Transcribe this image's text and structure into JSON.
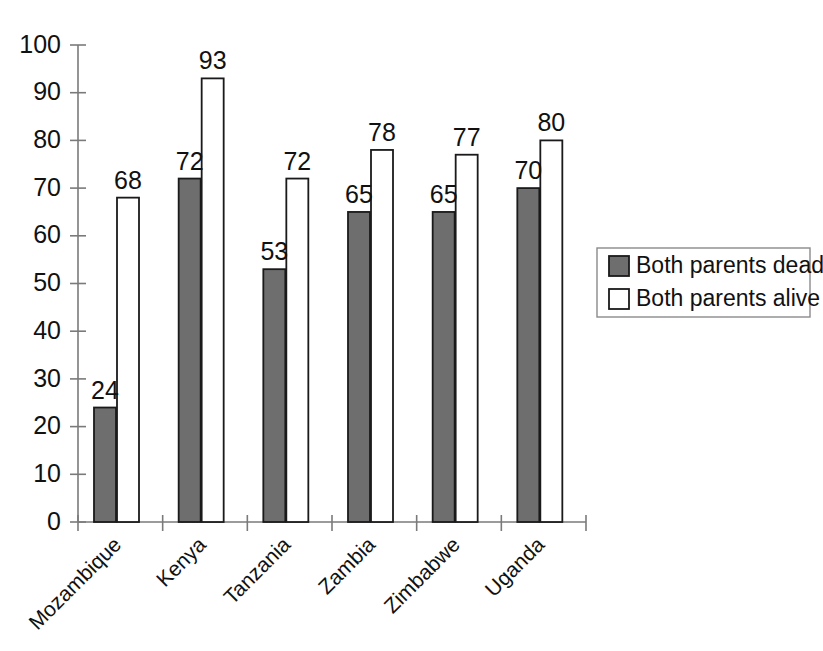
{
  "chart_data": {
    "type": "bar",
    "title": "",
    "subtitle": "",
    "xlabel": "",
    "ylabel": "",
    "ylim": [
      0,
      100
    ],
    "yticks": [
      0,
      10,
      20,
      30,
      40,
      50,
      60,
      70,
      80,
      90,
      100
    ],
    "ytick_labels": [
      "0",
      "10",
      "20",
      "30",
      "40",
      "50",
      "60",
      "70",
      "80",
      "90",
      "100"
    ],
    "grid": false,
    "legend_position": "right",
    "categories": [
      "Mozambique",
      "Kenya",
      "Tanzania",
      "Zambia",
      "Zimbabwe",
      "Uganda"
    ],
    "series": [
      {
        "name": "Both parents dead",
        "color": "#6e6e6e",
        "values": [
          24,
          72,
          53,
          65,
          65,
          70
        ],
        "value_labels": [
          "24",
          "72",
          "53",
          "65",
          "65",
          "70"
        ]
      },
      {
        "name": "Both parents alive",
        "color": "#ffffff",
        "values": [
          68,
          93,
          72,
          78,
          77,
          80
        ],
        "value_labels": [
          "68",
          "93",
          "72",
          "78",
          "77",
          "80"
        ]
      }
    ]
  },
  "legend": {
    "entries": [
      {
        "label": "Both parents dead",
        "swatch": "#6e6e6e"
      },
      {
        "label": "Both parents alive",
        "swatch": "#ffffff"
      }
    ]
  },
  "colors": {
    "background": "#ffffff",
    "axis": "#7a7a7a",
    "outline": "#1a1a1a",
    "series_dead": "#6e6e6e",
    "series_alive": "#ffffff",
    "text": "#111111"
  }
}
